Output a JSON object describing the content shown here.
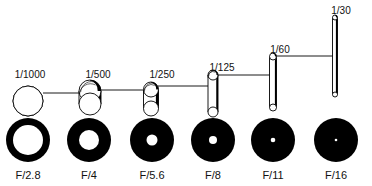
{
  "diagram": {
    "colors": {
      "ink": "#000000",
      "paper": "#ffffff"
    },
    "shutter_speeds": [
      {
        "label": "1/1000",
        "cx": 28,
        "top": 86,
        "bottom": 116,
        "r": 15,
        "label_y": 70,
        "label_x": 30
      },
      {
        "label": "1/500",
        "cx": 90,
        "top": 80,
        "bottom": 115,
        "r": 11,
        "label_y": 70,
        "label_x": 98
      },
      {
        "label": "1/250",
        "cx": 151,
        "top": 82,
        "bottom": 116,
        "r": 7.5,
        "label_y": 70,
        "label_x": 162
      },
      {
        "label": "1/125",
        "cx": 213,
        "top": 70,
        "bottom": 117,
        "r": 5,
        "label_y": 63,
        "label_x": 222
      },
      {
        "label": "1/60",
        "cx": 273,
        "top": 53,
        "bottom": 111,
        "r": 3.5,
        "label_y": 45,
        "label_x": 280
      },
      {
        "label": "1/30",
        "cx": 335,
        "top": 15,
        "bottom": 97,
        "r": 2.5,
        "label_y": 6,
        "label_x": 341
      }
    ],
    "connectors": [
      {
        "x1": 43,
        "x2": 79,
        "y": 93
      },
      {
        "x1": 101,
        "x2": 143,
        "y": 90
      },
      {
        "x1": 158,
        "x2": 208,
        "y": 86
      },
      {
        "x1": 218,
        "x2": 270,
        "y": 75
      },
      {
        "x1": 276,
        "x2": 333,
        "y": 56
      }
    ],
    "apertures": [
      {
        "label": "F/2.8",
        "cx": 28,
        "cy": 140,
        "r": 22,
        "hole": 15
      },
      {
        "label": "F/4",
        "cx": 89,
        "cy": 140,
        "r": 22,
        "hole": 10
      },
      {
        "label": "F/5.6",
        "cx": 152,
        "cy": 140,
        "r": 22,
        "hole": 5.5
      },
      {
        "label": "F/8",
        "cx": 213,
        "cy": 140,
        "r": 22,
        "hole": 4
      },
      {
        "label": "F/11",
        "cx": 273,
        "cy": 140,
        "r": 22,
        "hole": 2.3
      },
      {
        "label": "F/16",
        "cx": 336,
        "cy": 140,
        "r": 22,
        "hole": 1.3
      }
    ],
    "aperture_label_y": 170
  }
}
